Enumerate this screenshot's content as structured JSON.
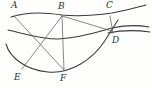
{
  "figure": {
    "background_color": "#fefefd",
    "curve_color": "#3a3a3c",
    "chord_color": "#55555a",
    "label_color": "#2e2e30"
  },
  "labels": {
    "a": "A",
    "b": "B",
    "c": "C",
    "d": "D",
    "e": "E",
    "f": "F"
  },
  "chart_data": {
    "type": "scatter",
    "xlabel": "",
    "ylabel": "",
    "xlim": [
      0,
      152
    ],
    "ylim": [
      0,
      88
    ],
    "grid": false,
    "legend": "none",
    "points": [
      {
        "name": "A",
        "x": 16,
        "y": 14
      },
      {
        "name": "B",
        "x": 62,
        "y": 15
      },
      {
        "name": "C",
        "x": 110,
        "y": 15
      },
      {
        "name": "D",
        "x": 113,
        "y": 35
      },
      {
        "name": "E",
        "x": 23,
        "y": 68
      },
      {
        "name": "F",
        "x": 64,
        "y": 70
      }
    ],
    "curves": [
      {
        "name": "upper-curve",
        "path": "M 11,17 C 30,11 48,13 62,15 C 80,17 98,15 112,13 C 124,11 134,8 146,5"
      },
      {
        "name": "middle-curve",
        "path": "M 8,30 C 22,33 40,39 58,39 C 80,38 98,32 112,28 C 126,25 138,25 149,27"
      },
      {
        "name": "middle-curve-lower-edge",
        "path": "M 108,33 C 122,30 136,30 150,32"
      },
      {
        "name": "lower-curve",
        "path": "M 6,44 C 10,58 26,70 48,72 C 70,74 92,60 104,42 C 110,33 114,26 118,20"
      }
    ],
    "chords": [
      {
        "name": "A-F",
        "from": "A",
        "to": "F",
        "x1": 14,
        "y1": 16,
        "x2": 64,
        "y2": 70
      },
      {
        "name": "B-E",
        "from": "B",
        "to": "E",
        "x1": 62,
        "y1": 16,
        "x2": 22,
        "y2": 69
      },
      {
        "name": "B-F",
        "from": "B",
        "to": "F",
        "x1": 62,
        "y1": 16,
        "x2": 64,
        "y2": 70
      },
      {
        "name": "B-D",
        "from": "B",
        "to": "D",
        "x1": 62,
        "y1": 16,
        "x2": 112,
        "y2": 31
      },
      {
        "name": "C-D",
        "from": "C",
        "to": "D",
        "x1": 110,
        "y1": 16,
        "x2": 113,
        "y2": 33
      }
    ],
    "intersections": [
      {
        "name": "AF-BE-crossing",
        "x": 38,
        "y": 39
      }
    ]
  }
}
